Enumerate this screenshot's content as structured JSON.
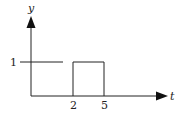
{
  "diagram": {
    "type": "signal-plot",
    "axes": {
      "x_label": "t",
      "y_label": "y"
    },
    "ticks": {
      "y_level": "1",
      "x_start": "2",
      "x_end": "5"
    },
    "segments": [
      {
        "description": "horizontal segment at y=1 from t<0 to just before t=2 (gap before 2)",
        "y": 1
      },
      {
        "description": "rectangular pulse of height 1 from t=2 to t=5",
        "start": 2,
        "end": 5,
        "height": 1
      }
    ],
    "colors": {
      "stroke": "#222222",
      "background": "#ffffff"
    }
  }
}
